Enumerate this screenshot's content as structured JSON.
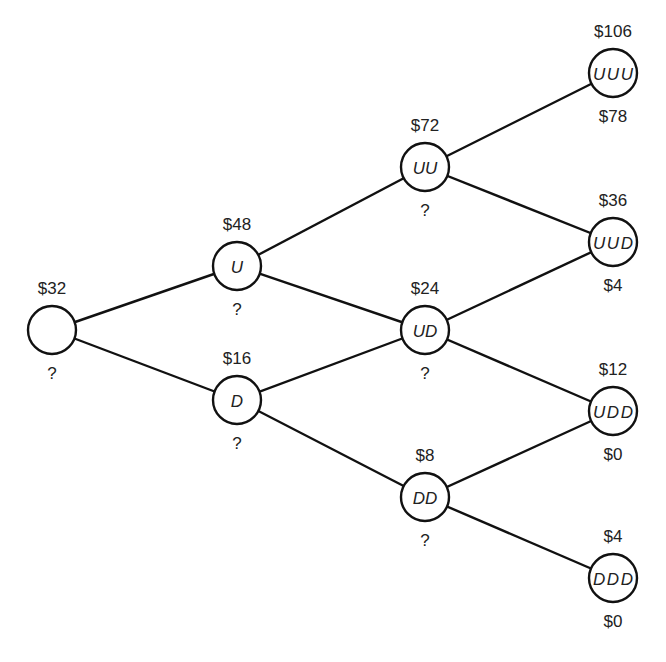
{
  "diagram": {
    "type": "binomial-tree",
    "periods": 3,
    "nodes": [
      {
        "id": "root",
        "label": "",
        "price": "$32",
        "option_value": "?"
      },
      {
        "id": "U",
        "label": "U",
        "price": "$48",
        "option_value": "?"
      },
      {
        "id": "D",
        "label": "D",
        "price": "$16",
        "option_value": "?"
      },
      {
        "id": "UU",
        "label": "UU",
        "price": "$72",
        "option_value": "?"
      },
      {
        "id": "UD",
        "label": "UD",
        "price": "$24",
        "option_value": "?"
      },
      {
        "id": "DD",
        "label": "DD",
        "price": "$8",
        "option_value": "?"
      },
      {
        "id": "UUU",
        "label": "UUU",
        "price": "$106",
        "option_value": "$78"
      },
      {
        "id": "UUD",
        "label": "UUD",
        "price": "$36",
        "option_value": "$4"
      },
      {
        "id": "UDD",
        "label": "UDD",
        "price": "$12",
        "option_value": "$0"
      },
      {
        "id": "DDD",
        "label": "DDD",
        "price": "$4",
        "option_value": "$0"
      }
    ],
    "edges": [
      [
        "root",
        "U"
      ],
      [
        "root",
        "D"
      ],
      [
        "U",
        "UU"
      ],
      [
        "U",
        "UD"
      ],
      [
        "D",
        "UD"
      ],
      [
        "D",
        "DD"
      ],
      [
        "UU",
        "UUU"
      ],
      [
        "UU",
        "UUD"
      ],
      [
        "UD",
        "UUD"
      ],
      [
        "UD",
        "UDD"
      ],
      [
        "DD",
        "UDD"
      ],
      [
        "DD",
        "DDD"
      ]
    ]
  }
}
